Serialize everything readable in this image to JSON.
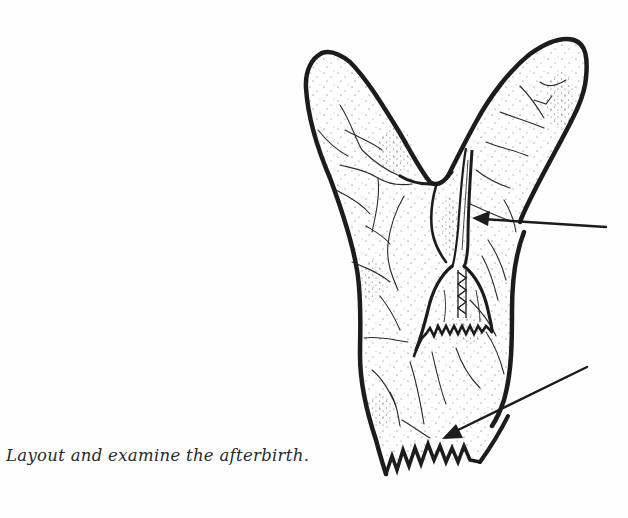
{
  "page": {
    "background": "#fefefe",
    "ink_color": "#1c1c1c"
  },
  "figure": {
    "parts": [
      {
        "name": "left-horn",
        "description": "left lobe of membranes"
      },
      {
        "name": "right-horn",
        "description": "right lobe of membranes"
      },
      {
        "name": "umbilical-cord",
        "description": "cord running down center"
      },
      {
        "name": "torn-inner-edge",
        "description": "jagged torn edge around cord attachment"
      },
      {
        "name": "torn-bottom-edge",
        "description": "jagged torn edge at bottom of membrane"
      }
    ],
    "arrows": [
      {
        "name": "arrow-umbilical-cord",
        "from": [
          606,
          227
        ],
        "to": [
          473,
          218
        ],
        "label": ""
      },
      {
        "name": "arrow-torn-edge",
        "from": [
          587,
          367
        ],
        "to": [
          443,
          438
        ],
        "label": ""
      }
    ]
  },
  "caption": {
    "text": "Layout and examine the afterbirth."
  }
}
